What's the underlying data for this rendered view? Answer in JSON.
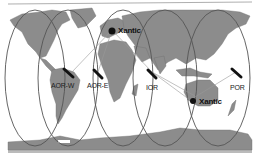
{
  "map": {
    "title": "Satellite ocean region coverage",
    "colors": {
      "land": "#8c8c8c",
      "sea": "#ffffff",
      "coverage": "#555555",
      "link": "#999999",
      "station": "#111111"
    },
    "satellites": [
      {
        "id": "aor-w",
        "label": "AOR-W"
      },
      {
        "id": "aor-e",
        "label": "AOR-E"
      },
      {
        "id": "ior",
        "label": "IOR"
      },
      {
        "id": "por",
        "label": "POR"
      }
    ],
    "stations": [
      {
        "id": "europe",
        "label": "Xantic"
      },
      {
        "id": "australia",
        "label": "Xantic"
      }
    ]
  }
}
